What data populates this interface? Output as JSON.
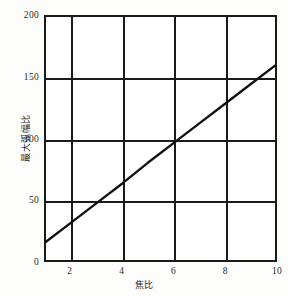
{
  "chart_data": {
    "type": "line",
    "title": "",
    "xlabel": "焦比",
    "ylabel": "最大弧幅比",
    "xlim": [
      1,
      10
    ],
    "ylim": [
      0,
      200
    ],
    "grid": true,
    "legend": null,
    "xticks": [
      2,
      4,
      6,
      8,
      10
    ],
    "xtick_labels": [
      "2",
      "4",
      "6",
      "8",
      "10"
    ],
    "yticks": [
      0,
      50,
      100,
      150,
      200
    ],
    "ytick_labels": [
      "0",
      "50",
      "100",
      "150",
      "200"
    ],
    "x_gridlines": [
      2,
      4,
      6,
      8
    ],
    "y_gridlines": [
      50,
      100,
      150
    ],
    "line_color": "#111111",
    "series": [
      {
        "name": "最大弧幅比",
        "x": [
          1,
          2,
          3,
          4,
          5,
          6,
          7,
          8,
          9,
          10
        ],
        "y": [
          15,
          31,
          47,
          63,
          80,
          96,
          112,
          128,
          144,
          160
        ]
      }
    ]
  },
  "axes": {
    "y_title": "最大弧幅比",
    "x_title": "焦比"
  }
}
